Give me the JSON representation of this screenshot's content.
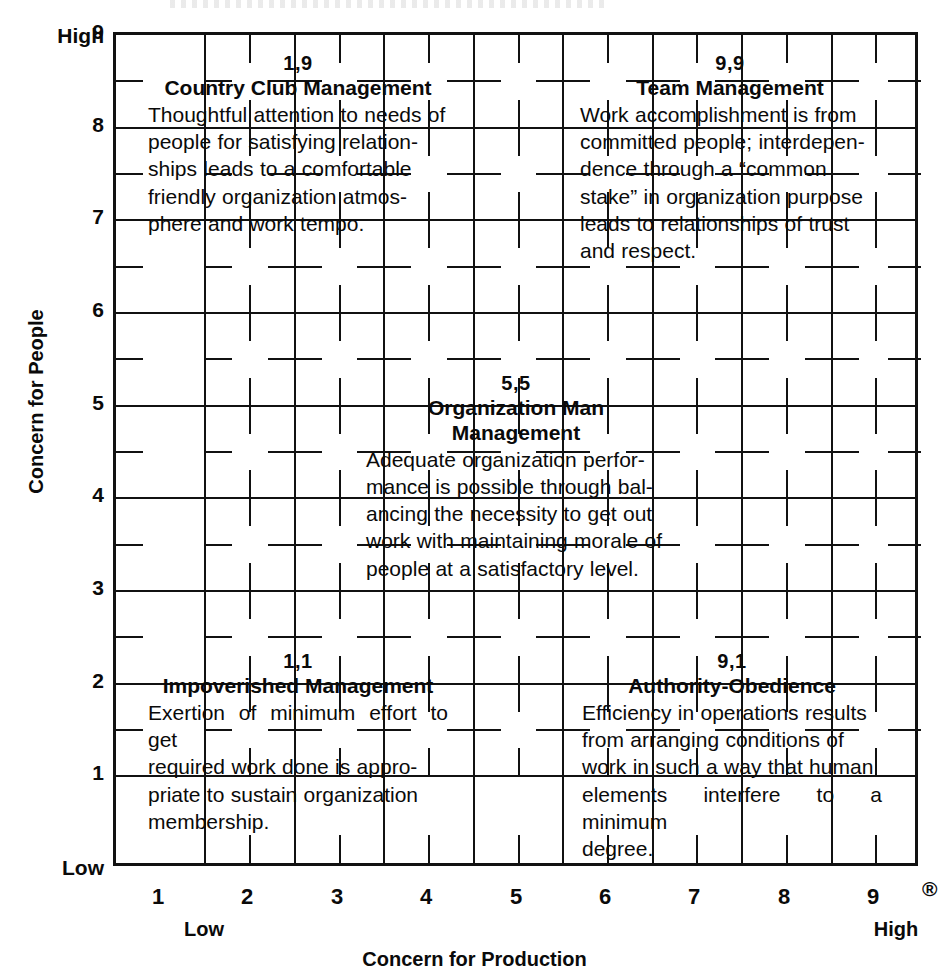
{
  "chart_data": {
    "type": "table",
    "xlabel": "Concern for Production",
    "ylabel": "Concern for People",
    "xlim": [
      0,
      9
    ],
    "ylim": [
      0,
      9
    ],
    "grid": true,
    "x_ticks": [
      "1",
      "2",
      "3",
      "4",
      "5",
      "6",
      "7",
      "8",
      "9"
    ],
    "y_ticks": [
      "1",
      "2",
      "3",
      "4",
      "5",
      "6",
      "7",
      "8",
      "9"
    ],
    "x_axis_low": "Low",
    "x_axis_high": "High",
    "y_axis_low": "Low",
    "y_axis_high": "High",
    "registered_mark": "®",
    "cells": [
      {
        "coord": "1,9",
        "x": 1,
        "y": 9,
        "title": "Country Club Management",
        "lines": [
          "Thoughtful attention to needs of",
          "people for satisfying relation-",
          "ships leads to a comfortable",
          "friendly organization atmos-",
          "phere and work tempo."
        ]
      },
      {
        "coord": "9,9",
        "x": 9,
        "y": 9,
        "title": "Team Management",
        "lines": [
          "Work accomplishment is from",
          "committed people; interdepen-",
          "dence through a “common",
          "stake” in organization purpose",
          "leads to relationships of trust",
          "and respect."
        ]
      },
      {
        "coord": "5,5",
        "x": 5,
        "y": 5,
        "title": "Organization Man Management",
        "lines": [
          "Adequate organization perfor-",
          "mance is possible through bal-",
          "ancing the necessity to get out",
          "work with maintaining morale of",
          "people at a satisfactory level."
        ]
      },
      {
        "coord": "1,1",
        "x": 1,
        "y": 1,
        "title": "Impoverished Management",
        "lines": [
          "Exertion of minimum effort to get",
          "required work done is appro-",
          "priate to sustain organization",
          "membership."
        ]
      },
      {
        "coord": "9,1",
        "x": 9,
        "y": 1,
        "title": "Authority-Obedience",
        "lines": [
          "Efficiency in operations results",
          "from arranging conditions of",
          "work in such a way that human",
          "elements interfere to a minimum",
          "degree."
        ]
      }
    ]
  },
  "axes": {
    "y": {
      "title": "Concern for People",
      "high": "High",
      "low": "Low",
      "ticks": [
        "9",
        "8",
        "7",
        "6",
        "5",
        "4",
        "3",
        "2",
        "1"
      ]
    },
    "x": {
      "title": "Concern for Production",
      "high": "High",
      "low": "Low",
      "ticks": [
        "1",
        "2",
        "3",
        "4",
        "5",
        "6",
        "7",
        "8",
        "9"
      ]
    }
  },
  "marks": {
    "registered": "®"
  },
  "colors": {
    "ink": "#111111",
    "background": "#ffffff"
  }
}
